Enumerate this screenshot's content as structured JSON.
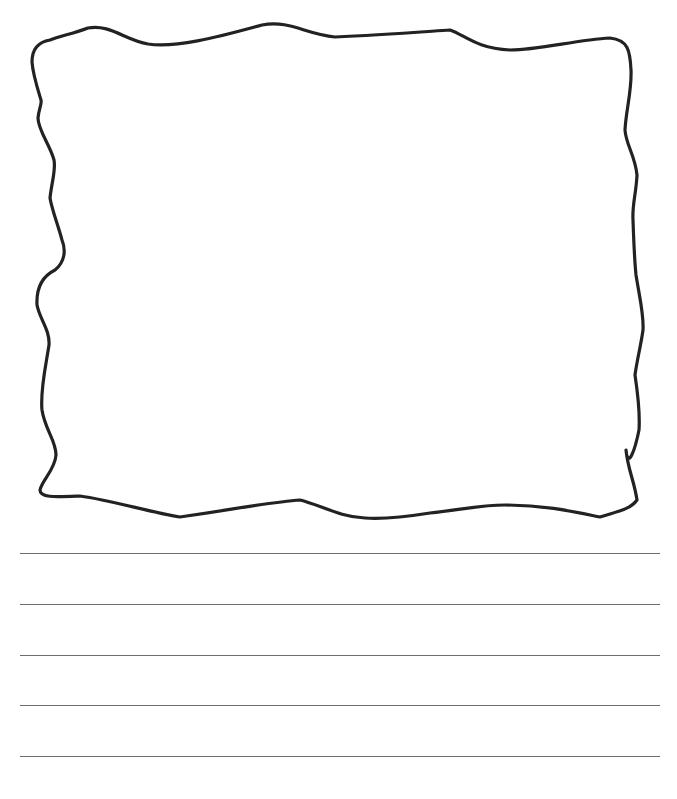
{
  "page": {
    "background": "#ffffff",
    "width": 677,
    "height": 799
  },
  "drawing_frame": {
    "stroke_color": "#222222",
    "stroke_width": 3.2,
    "shape": "hand-drawn-wavy-rectangle"
  },
  "writing_lines": {
    "color": "#6e6e6e",
    "x_start": 20,
    "x_end": 660,
    "items": [
      {
        "y": 553
      },
      {
        "y": 604
      },
      {
        "y": 655
      },
      {
        "y": 705
      },
      {
        "y": 756
      }
    ]
  }
}
